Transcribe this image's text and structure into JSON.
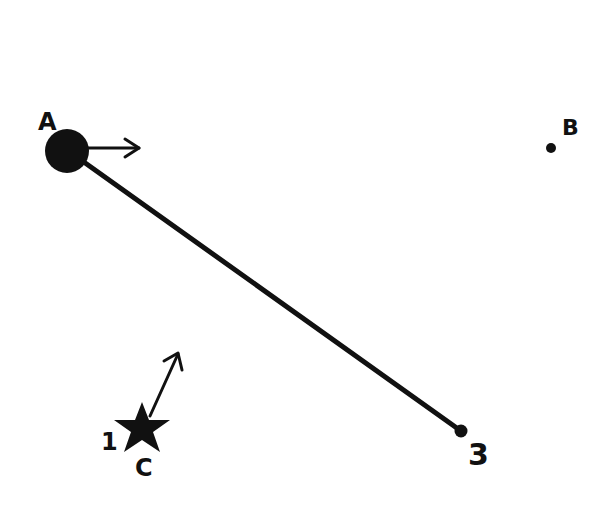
{
  "diagram": {
    "background": "#ffffff",
    "ink_color": "#111111",
    "points": [
      {
        "id": "A",
        "label": "A",
        "x": 67,
        "y": 150,
        "r": 22,
        "marker": "large-dot"
      },
      {
        "id": "B",
        "label": "B",
        "x": 551,
        "y": 148,
        "r": 5,
        "marker": "small-dot"
      },
      {
        "id": "3",
        "label": "3",
        "x": 461,
        "y": 431,
        "r": 6,
        "marker": "small-dot"
      },
      {
        "id": "C",
        "label": "C",
        "x": 142,
        "y": 428,
        "marker": "star",
        "secondary_label": "1"
      }
    ],
    "segments": [
      {
        "from": "A",
        "to": "3"
      }
    ],
    "arrows": [
      {
        "from_point": "A",
        "x1": 89,
        "y1": 148,
        "x2": 140,
        "y2": 148,
        "direction": "right"
      },
      {
        "from_point": "C",
        "x1": 152,
        "y1": 410,
        "x2": 178,
        "y2": 353,
        "direction": "up-right"
      }
    ],
    "labels": {
      "A": "A",
      "B": "B",
      "C": "C",
      "three": "3",
      "one": "1"
    }
  }
}
